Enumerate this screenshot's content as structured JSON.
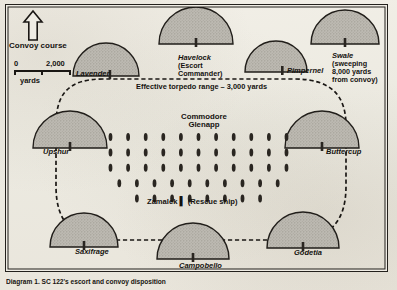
{
  "diagram": {
    "caption": "Diagram 1. SC 122's escort and convoy disposition",
    "convoy_course_label": "Convoy course",
    "scale": {
      "zero": "0",
      "max": "2,000",
      "units": "yards"
    },
    "torpedo_range_label": "Effective torpedo range – 3,000 yards",
    "commodore": {
      "line1": "Commodore",
      "line2": "Glenapp"
    },
    "rescue_ship": {
      "name": "Zamalek",
      "marker": "▌",
      "role": "(Rescue ship)"
    },
    "colors": {
      "paper": "#efece4",
      "ink": "#1a1714",
      "escort_fill": "#b9b6ae",
      "escort_stroke": "#211e1a",
      "ship_marker": "#2a2621"
    },
    "escorts": [
      {
        "name": "Lavender",
        "label_lines": [
          "Lavender"
        ]
      },
      {
        "name": "Havelock",
        "label_lines": [
          "Havelock",
          "(Escort",
          "Commander)"
        ]
      },
      {
        "name": "Pimpernel",
        "label_lines": [
          "Pimpernel"
        ]
      },
      {
        "name": "Swale",
        "label_lines": [
          "Swale",
          "(sweeping",
          "8,000 yards",
          "from convoy)"
        ]
      },
      {
        "name": "Upshur",
        "label_lines": [
          "Upshur"
        ]
      },
      {
        "name": "Buttercup",
        "label_lines": [
          "Buttercup"
        ]
      },
      {
        "name": "Saxifrage",
        "label_lines": [
          "Saxifrage"
        ]
      },
      {
        "name": "Campobello",
        "label_lines": [
          "Campobello"
        ]
      },
      {
        "name": "Godetia",
        "label_lines": [
          "Godetia"
        ]
      }
    ],
    "convoy_formation": {
      "description": "Merchant ship columns in trapezoidal block formation",
      "rows": [
        11,
        11,
        11,
        10,
        8
      ]
    }
  }
}
